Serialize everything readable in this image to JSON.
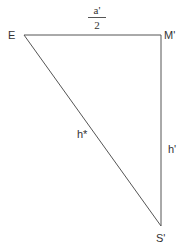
{
  "diagram": {
    "type": "right-triangle",
    "stroke_color": "#555555",
    "vertices": [
      {
        "id": "E",
        "label": "E",
        "x": 24,
        "y": 35
      },
      {
        "id": "M",
        "label": "M'",
        "x": 161,
        "y": 35
      },
      {
        "id": "S",
        "label": "S'",
        "x": 161,
        "y": 226
      }
    ],
    "edges": [
      {
        "from": "E",
        "to": "M",
        "label_numerator": "a'",
        "label_denominator": "2"
      },
      {
        "from": "M",
        "to": "S",
        "label": "h'"
      },
      {
        "from": "E",
        "to": "S",
        "label": "h*"
      }
    ]
  }
}
